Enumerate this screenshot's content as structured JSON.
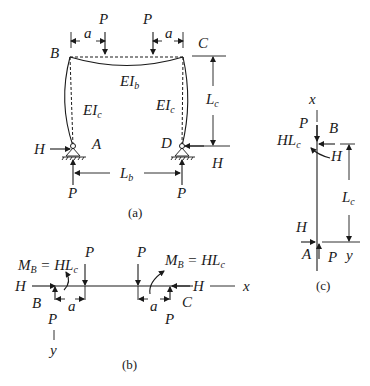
{
  "figure_a": {
    "caption": "(a)",
    "labels": {
      "B": "B",
      "C": "C",
      "A": "A",
      "D": "D",
      "P_top_left": "P",
      "P_top_right": "P",
      "a_left": "a",
      "a_right": "a",
      "EI_b_main": "EI",
      "EI_b_sub": "b",
      "EI_c_left_main": "EI",
      "EI_c_left_sub": "c",
      "EI_c_right_main": "EI",
      "EI_c_right_sub": "c",
      "L_c_main": "L",
      "L_c_sub": "c",
      "L_b_main": "L",
      "L_b_sub": "b",
      "H_left": "H",
      "H_right": "H",
      "P_bottom_left": "P",
      "P_bottom_right": "P"
    }
  },
  "figure_b": {
    "caption": "(b)",
    "labels": {
      "MB_left_M": "M",
      "MB_left_sub": "B",
      "MB_left_eq": " = HL",
      "MB_left_c": "c",
      "MB_right_M": "M",
      "MB_right_sub": "B",
      "MB_right_eq": " = HL",
      "MB_right_c": "c",
      "P_top_left": "P",
      "P_top_right": "P",
      "H_left": "H",
      "H_right": "H",
      "B": "B",
      "C": "C",
      "a_left": "a",
      "a_right": "a",
      "P_bottom_left": "P",
      "P_bottom_right": "P",
      "x_axis": "x",
      "y_axis": "y"
    }
  },
  "figure_c": {
    "caption": "(c)",
    "labels": {
      "x_axis": "x",
      "P_top": "P",
      "B": "B",
      "HLc_main": "HL",
      "HLc_sub": "c",
      "H_top": "H",
      "L_c_main": "L",
      "L_c_sub": "c",
      "H_bottom": "H",
      "A": "A",
      "P_bottom": "P",
      "y_axis": "y"
    }
  }
}
